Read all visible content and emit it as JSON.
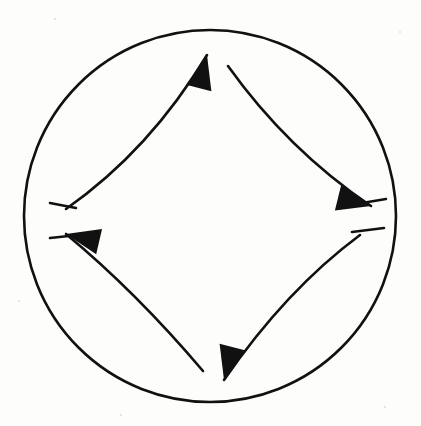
{
  "figure": {
    "background_color": "#fdfdfc",
    "stroke_color": "#111111",
    "fill_color": "#111111",
    "caption": "",
    "width": 421,
    "height": 426
  },
  "boundary_circle": {
    "name": "boundary-circle",
    "center_x": 210,
    "center_y": 216,
    "radius": 186,
    "stroke_width": 2.6,
    "fill": "none",
    "stroke_color": "#111111"
  },
  "arrows": [
    {
      "id": "arrow-left-to-top",
      "label": "left to top",
      "from": "left",
      "to": "top",
      "direction": "counterclockwise",
      "tail_x": 66,
      "tail_y": 209,
      "control_x": 150,
      "control_y": 150,
      "tip_x": 207,
      "tip_y": 55,
      "head_angle_deg": -76,
      "head_length": 34,
      "head_width": 26,
      "stub": {
        "x1": 50,
        "y1": 203,
        "x2": 76,
        "y2": 208
      }
    },
    {
      "id": "arrow-top-to-right",
      "label": "top to right",
      "from": "top",
      "to": "right",
      "direction": "counterclockwise",
      "tail_x": 228,
      "tail_y": 66,
      "control_x": 288,
      "control_y": 150,
      "tip_x": 371,
      "tip_y": 206,
      "head_angle_deg": 14,
      "head_length": 34,
      "head_width": 26,
      "stub": {
        "x1": 362,
        "y1": 203,
        "x2": 386,
        "y2": 199
      }
    },
    {
      "id": "arrow-right-to-bottom",
      "label": "right to bottom",
      "from": "right",
      "to": "bottom",
      "direction": "counterclockwise",
      "tail_x": 360,
      "tail_y": 235,
      "control_x": 286,
      "control_y": 290,
      "tip_x": 224,
      "tip_y": 380,
      "head_angle_deg": 104,
      "head_length": 34,
      "head_width": 26,
      "stub": {
        "x1": 352,
        "y1": 232,
        "x2": 384,
        "y2": 228
      }
    },
    {
      "id": "arrow-bottom-to-left",
      "label": "bottom to left",
      "from": "bottom",
      "to": "left",
      "direction": "counterclockwise",
      "tail_x": 203,
      "tail_y": 371,
      "control_x": 136,
      "control_y": 292,
      "tip_x": 66,
      "tip_y": 234,
      "head_angle_deg": 193,
      "head_length": 34,
      "head_width": 26,
      "stub": {
        "x1": 50,
        "y1": 238,
        "x2": 78,
        "y2": 235
      }
    }
  ],
  "speckles": [
    {
      "x": 54,
      "y": 18,
      "size": 2
    },
    {
      "x": 399,
      "y": 31,
      "size": 2
    },
    {
      "x": 18,
      "y": 300,
      "size": 2
    },
    {
      "x": 384,
      "y": 406,
      "size": 2
    },
    {
      "x": 120,
      "y": 414,
      "size": 2
    }
  ]
}
